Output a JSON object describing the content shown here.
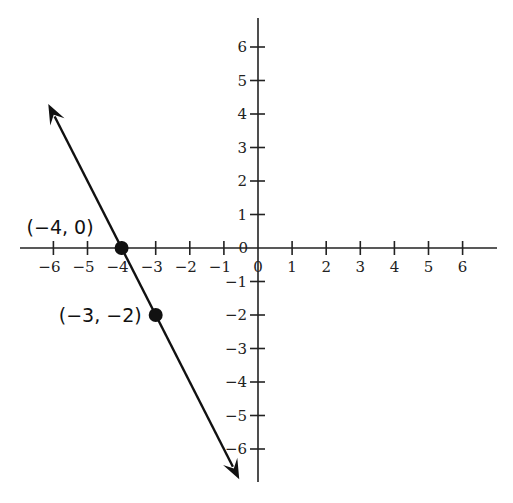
{
  "chart_data": {
    "type": "line",
    "title": "",
    "xlabel": "",
    "ylabel": "",
    "xlim": [
      -6.9,
      6.9
    ],
    "ylim": [
      -7.0,
      6.9
    ],
    "grid": false,
    "x_ticks": [
      -6,
      -5,
      -4,
      -3,
      -2,
      -1,
      0,
      1,
      2,
      3,
      4,
      5,
      6
    ],
    "y_ticks": [
      -6,
      -5,
      -4,
      -3,
      -2,
      -1,
      0,
      1,
      2,
      3,
      4,
      5,
      6
    ],
    "x_tick_labels": [
      "−6",
      "−5",
      "−4",
      "−3",
      "−2",
      "−1",
      "0",
      "1",
      "2",
      "3",
      "4",
      "5",
      "6"
    ],
    "y_tick_labels": [
      "−6",
      "−5",
      "−4",
      "−3",
      "−2",
      "−1",
      "0",
      "1",
      "2",
      "3",
      "4",
      "5",
      "6"
    ],
    "series": [
      {
        "name": "line",
        "slope": -2,
        "intercept": -8,
        "x": [
          -6.15,
          -0.55
        ],
        "y": [
          4.3,
          -6.9
        ],
        "arrows": "both",
        "color": "#111111"
      }
    ],
    "points": [
      {
        "x": -4,
        "y": 0,
        "label": "(−4, 0)"
      },
      {
        "x": -3,
        "y": -2,
        "label": "(−3, −2)"
      }
    ]
  },
  "labels": {
    "point_a": "(−4, 0)",
    "point_b": "(−3, −2)"
  },
  "colors": {
    "axis": "#222222",
    "line": "#111111",
    "point": "#111111",
    "background": "#ffffff"
  }
}
